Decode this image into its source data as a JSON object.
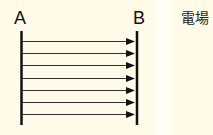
{
  "diagram": {
    "plate_a_label": "A",
    "plate_b_label": "B",
    "caption": "電場",
    "arrow_count": 7,
    "arrow_direction": "A-to-B",
    "line_color": "#111111",
    "background_color": "#fffbe8"
  }
}
